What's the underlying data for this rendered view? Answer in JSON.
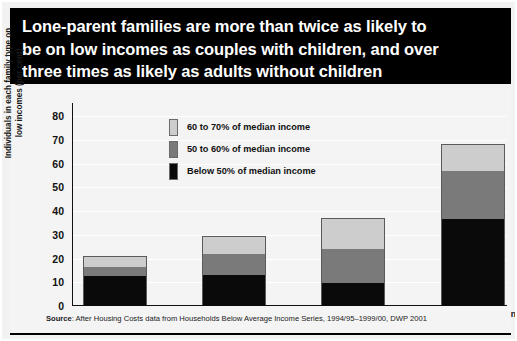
{
  "title": "Lone-parent families are more than twice as likely to\nbe on low incomes as couples with children, and over\nthree times as likely as adults without children",
  "source": {
    "prefix": "Source",
    "text": ": After Housing Costs data from Households Below Average Income Series, 1994/95–1999/00, DWP 2001"
  },
  "colors": {
    "banner_bg": "#000000",
    "banner_text": "#ffffff",
    "panel_bg": "#f4f4f4",
    "below_50": "#0a0a0a",
    "between_50_60": "#7a7a7a",
    "between_60_70": "#cdcdcd",
    "axis": "#111111"
  },
  "chart_data": {
    "type": "bar",
    "stacked": true,
    "title": "Lone-parent families are more than twice as likely to be on low incomes as couples with children, and over three times as likely as adults without children",
    "xlabel": "",
    "ylabel": "Individuals in each family type on\nlow incomes (per cent)",
    "ylim": [
      0,
      80
    ],
    "yticks": [
      0,
      10,
      20,
      30,
      40,
      50,
      60,
      70,
      80
    ],
    "ytick_labels": [
      "0",
      "10",
      "20",
      "30",
      "40",
      "50",
      "60",
      "70",
      "80"
    ],
    "grid": true,
    "legend_position": "upper-left-inside",
    "categories": [
      "Adults, no children",
      "Couples with children",
      "Pensioners",
      "Singles with children"
    ],
    "series": [
      {
        "name": "Below 50% of median income",
        "color": "#0a0a0a",
        "values": [
          12.5,
          13,
          9.5,
          36.5
        ]
      },
      {
        "name": "50 to 60% of median income",
        "color": "#7a7a7a",
        "values": [
          4,
          9,
          14.5,
          20.5
        ]
      },
      {
        "name": "60 to 70% of median income",
        "color": "#cdcdcd",
        "values": [
          4,
          7,
          12.5,
          11
        ]
      }
    ],
    "totals": [
      20.5,
      29,
      36.5,
      68
    ]
  },
  "legend": [
    {
      "label": "60 to 70% of median income",
      "color": "#cdcdcd"
    },
    {
      "label": "50 to 60% of median income",
      "color": "#7a7a7a"
    },
    {
      "label": "Below 50% of median income",
      "color": "#0a0a0a"
    }
  ]
}
